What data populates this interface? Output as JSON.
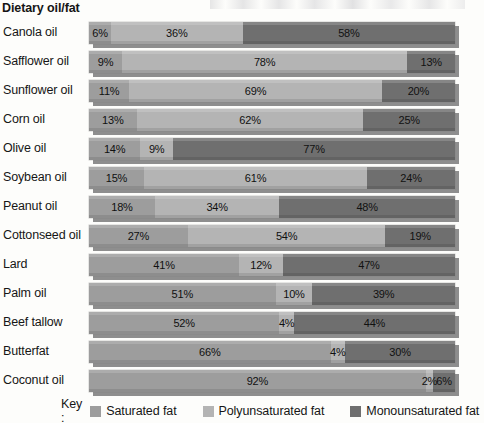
{
  "axis_title": "Dietary oil/fat",
  "legend": {
    "key_label": "Key :",
    "items": [
      {
        "label": "Saturated fat",
        "color": "#9d9d9d"
      },
      {
        "label": "Polyunsaturated fat",
        "color": "#b4b4b4"
      },
      {
        "label": "Monounsaturated fat",
        "color": "#6f6f6f"
      }
    ]
  },
  "chart_data": {
    "type": "bar",
    "subtype": "stacked-horizontal-100pct",
    "title": "",
    "xlabel": "",
    "ylabel": "Dietary oil/fat",
    "xlim": [
      0,
      100
    ],
    "grid": false,
    "legend_position": "bottom",
    "categories": [
      "Canola oil",
      "Safflower oil",
      "Sunflower oil",
      "Corn oil",
      "Olive oil",
      "Soybean oil",
      "Peanut oil",
      "Cottonseed oil",
      "Lard",
      "Palm oil",
      "Beef tallow",
      "Butterfat",
      "Coconut oil"
    ],
    "series": [
      {
        "name": "Saturated fat",
        "color": "#9d9d9d",
        "values": [
          6,
          9,
          11,
          13,
          14,
          15,
          18,
          27,
          41,
          51,
          52,
          66,
          92
        ]
      },
      {
        "name": "Polyunsaturated fat",
        "color": "#b4b4b4",
        "values": [
          36,
          78,
          69,
          62,
          9,
          61,
          34,
          54,
          12,
          10,
          4,
          4,
          2
        ]
      },
      {
        "name": "Monounsaturated fat",
        "color": "#6f6f6f",
        "values": [
          58,
          13,
          20,
          25,
          77,
          24,
          48,
          19,
          47,
          39,
          44,
          30,
          6
        ]
      }
    ],
    "value_labels": [
      [
        "6%",
        "36%",
        "58%"
      ],
      [
        "9%",
        "78%",
        "13%"
      ],
      [
        "11%",
        "69%",
        "20%"
      ],
      [
        "13%",
        "62%",
        "25%"
      ],
      [
        "14%",
        "9%",
        "77%"
      ],
      [
        "15%",
        "61%",
        "24%"
      ],
      [
        "18%",
        "34%",
        "48%"
      ],
      [
        "27%",
        "54%",
        "19%"
      ],
      [
        "41%",
        "12%",
        "47%"
      ],
      [
        "51%",
        "10%",
        "39%"
      ],
      [
        "52%",
        "4%",
        "44%"
      ],
      [
        "66%",
        "4%",
        "30%"
      ],
      [
        "92%",
        "2%",
        "6%"
      ]
    ]
  }
}
